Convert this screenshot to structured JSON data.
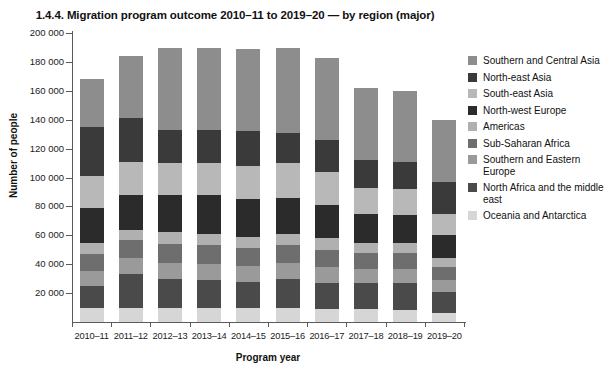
{
  "chart_data": {
    "type": "bar",
    "stacked": true,
    "title": "1.4.4. Migration program outcome 2010–11 to 2019–20 — by region (major)",
    "xlabel": "Program year",
    "ylabel": "Number of people",
    "ylim": [
      0,
      200000
    ],
    "ytick_step": 20000,
    "grid": false,
    "legend_position": "right",
    "ytick_labels": [
      "200 000",
      "180 000",
      "160 000",
      "140 000",
      "120 000",
      "100 000",
      "80 000",
      "60 000",
      "40 000",
      "20 000"
    ],
    "ytick_values": [
      200000,
      180000,
      160000,
      140000,
      120000,
      100000,
      80000,
      60000,
      40000,
      20000
    ],
    "categories": [
      "2010–11",
      "2011–12",
      "2012–13",
      "2013–14",
      "2014–15",
      "2015–16",
      "2016–17",
      "2017–18",
      "2018–19",
      "2019–20"
    ],
    "stack_order_bottom_to_top": [
      "Oceania and Antarctica",
      "North Africa and the middle east",
      "Southern and Eastern Europe",
      "Sub-Saharan Africa",
      "Americas",
      "North-west Europe",
      "South-east Asia",
      "North-east Asia",
      "Southern and Central Asia"
    ],
    "series": [
      {
        "name": "Southern and Central Asia",
        "color": "#8d8d8d",
        "values": [
          33000,
          43000,
          57000,
          57000,
          57000,
          59000,
          57000,
          50000,
          49000,
          43000
        ]
      },
      {
        "name": "North-east Asia",
        "color": "#3a3a3a",
        "values": [
          34000,
          30000,
          23000,
          23000,
          24000,
          21000,
          22000,
          19000,
          19000,
          22000
        ]
      },
      {
        "name": "South-east Asia",
        "color": "#b8b8b8",
        "values": [
          22000,
          23000,
          22000,
          22000,
          23000,
          24000,
          23000,
          18000,
          18000,
          15000
        ]
      },
      {
        "name": "North-west Europe",
        "color": "#2b2b2b",
        "values": [
          24000,
          24000,
          26000,
          27000,
          26000,
          25000,
          23000,
          20000,
          19000,
          16000
        ]
      },
      {
        "name": "Americas",
        "color": "#b0b0b0",
        "values": [
          8000,
          7000,
          8000,
          8000,
          8000,
          8000,
          8000,
          7000,
          7000,
          6000
        ]
      },
      {
        "name": "Sub-Saharan Africa",
        "color": "#6e6e6e",
        "values": [
          12000,
          13000,
          13000,
          13000,
          12000,
          12000,
          12000,
          11000,
          11000,
          9000
        ]
      },
      {
        "name": "Southern and Eastern Europe",
        "color": "#9a9a9a",
        "values": [
          10000,
          11000,
          11000,
          11000,
          11000,
          11000,
          11000,
          10000,
          10000,
          8000
        ]
      },
      {
        "name": "North Africa and the middle east",
        "color": "#4a4a4a",
        "values": [
          15000,
          23000,
          20000,
          19000,
          18000,
          20000,
          18000,
          18000,
          19000,
          15000
        ]
      },
      {
        "name": "Oceania and Antarctica",
        "color": "#d6d6d6",
        "values": [
          10000,
          10000,
          10000,
          10000,
          10000,
          10000,
          9000,
          9000,
          8000,
          6000
        ]
      }
    ],
    "totals": [
      168000,
      184000,
      190000,
      190000,
      189000,
      190000,
      183000,
      162000,
      160000,
      140000
    ]
  },
  "legend": {
    "items": [
      {
        "label": "Southern and Central Asia",
        "color": "#8d8d8d"
      },
      {
        "label": "North-east Asia",
        "color": "#3a3a3a"
      },
      {
        "label": "South-east Asia",
        "color": "#b8b8b8"
      },
      {
        "label": "North-west Europe",
        "color": "#2b2b2b"
      },
      {
        "label": "Americas",
        "color": "#b0b0b0"
      },
      {
        "label": "Sub-Saharan Africa",
        "color": "#6e6e6e"
      },
      {
        "label": "Southern and Eastern Europe",
        "color": "#9a9a9a"
      },
      {
        "label": "North Africa and the middle east",
        "color": "#4a4a4a"
      },
      {
        "label": "Oceania and Antarctica",
        "color": "#d6d6d6"
      }
    ]
  }
}
